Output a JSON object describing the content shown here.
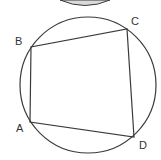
{
  "diagram": {
    "type": "cyclic-quadrilateral",
    "colors": {
      "stroke": "#3a3a3a",
      "label": "#333333",
      "top_shape_fill": "#d9d9d9",
      "background": "#ffffff"
    },
    "circle": {
      "cx": 88,
      "cy": 85,
      "r": 68
    },
    "points": [
      {
        "name": "A",
        "x": 30,
        "y": 122,
        "label_x": 16,
        "label_y": 132
      },
      {
        "name": "B",
        "x": 31,
        "y": 47,
        "label_x": 15,
        "label_y": 45
      },
      {
        "name": "C",
        "x": 127,
        "y": 29,
        "label_x": 131,
        "label_y": 25
      },
      {
        "name": "D",
        "x": 134,
        "y": 137,
        "label_x": 139,
        "label_y": 149
      }
    ],
    "labels": {
      "A": "A",
      "B": "B",
      "C": "C",
      "D": "D"
    },
    "top_shape": {
      "description": "partially visible gray ellipse cropped at top edge"
    }
  }
}
